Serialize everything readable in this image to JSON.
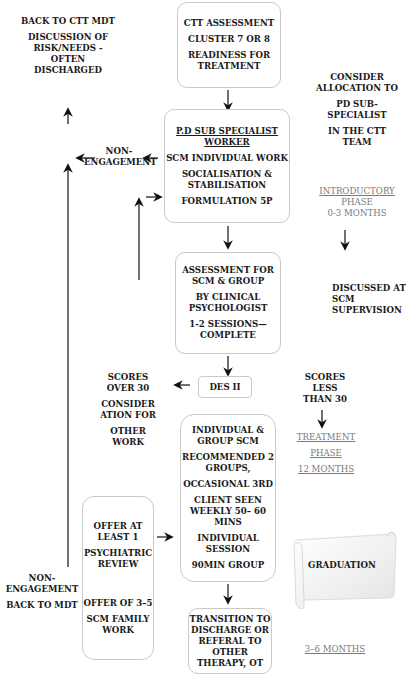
{
  "diagram": {
    "boxes": {
      "ctt_assessment": [
        "CTT ASSESSMENT",
        "CLUSTER 7 OR 8",
        "READINESS FOR TREATMENT"
      ],
      "pd_worker": {
        "title": "P.D SUB SPECIALIST WORKER",
        "lines": [
          "SCM INDIVIDUAL WORK",
          "SOCIALISATION & STABILISATION",
          "FORMULATION 5P"
        ]
      },
      "assessment_scm": [
        "ASSESSMENT FOR SCM & GROUP",
        "BY CLINICAL PSYCHOLOGIST",
        "1-2 SESSIONS— COMPLETE"
      ],
      "des": "DES II",
      "individual_group": [
        "INDIVIDUAL & GROUP SCM",
        "RECOMMENDED 2 GROUPS,",
        "OCCASIONAL 3RD",
        "CLIENT SEEN WEEKLY 50– 60 MINS",
        "INDIVIDUAL SESSION",
        "90MIN GROUP"
      ],
      "offer": [
        "OFFER AT LEAST 1",
        "PSYCHIATRIC REVIEW",
        "OFFER OF 3–5",
        "SCM FAMILY WORK"
      ],
      "transition": "TRANSITION TO DISCHARGE OR REFERAL TO OTHER THERAPY, OT",
      "graduation": "GRADUATION"
    },
    "labels": {
      "back_to_ctt": [
        "BACK TO CTT MDT",
        "DISCUSSION OF RISK/NEEDS - OFTEN DISCHARGED"
      ],
      "non_engagement_top": "NON- ENGAGEMENT",
      "consider_allocation": [
        "CONSIDER ALLOCATION TO",
        "PD SUB- SPECIALIST",
        "IN THE CTT TEAM"
      ],
      "introductory": "INTRODUCTORY",
      "introductory_phase": "PHASE",
      "introductory_months": "0-3 MONTHS",
      "discussed": "DISCUSSED AT SCM SUPERVISION",
      "scores_over": [
        "SCORES OVER 30",
        "CONSIDER ATION FOR",
        "OTHER WORK"
      ],
      "scores_less": "SCORES LESS THAN 30",
      "treatment": "TREATMENT",
      "treatment_phase": "PHASE",
      "treatment_months": "12 MONTHS",
      "non_engagement_bottom": [
        "NON- ENGAGEMENT",
        "BACK TO MDT"
      ],
      "months_3_6": "3–6 MONTHS"
    },
    "colors": {
      "line": "#111111",
      "border": "#c9c9c9",
      "muted": "#7a7a7a"
    }
  }
}
